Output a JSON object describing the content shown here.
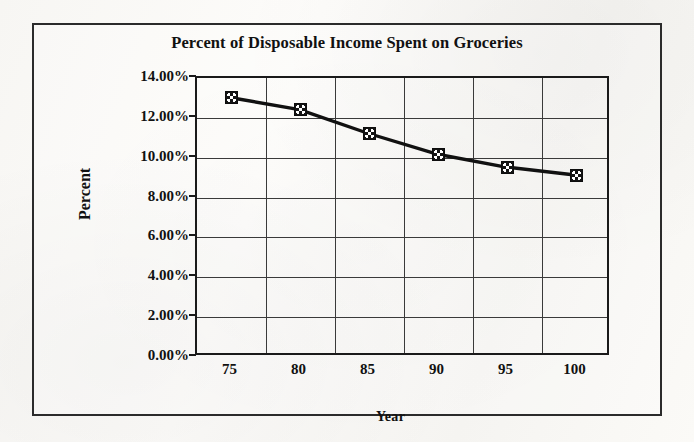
{
  "chart_data": {
    "type": "line",
    "title": "Percent of Disposable Income Spent on Groceries",
    "xlabel": "Year",
    "ylabel": "Percent",
    "categories": [
      "75",
      "80",
      "85",
      "90",
      "95",
      "100"
    ],
    "values": [
      13.0,
      12.4,
      11.2,
      10.15,
      9.5,
      9.1
    ],
    "series": [
      {
        "name": "Percent of Disposable Income Spent on Groceries",
        "values": [
          13.0,
          12.4,
          11.2,
          10.15,
          9.5,
          9.1
        ]
      }
    ],
    "ytick_labels": [
      "14.00%",
      "12.00%",
      "10.00%",
      "8.00%",
      "6.00%",
      "4.00%",
      "2.00%",
      "0.00%"
    ],
    "ytick_values": [
      14,
      12,
      10,
      8,
      6,
      4,
      2,
      0
    ],
    "ylim": [
      0,
      14
    ],
    "ytick_format": "percent",
    "grid": "both",
    "legend": "none",
    "line_color": "#111111",
    "marker_color": "#141414",
    "marker_shape": "square-dotted",
    "background_color": "#fbfaf8",
    "border_color": "#2b2b2b"
  }
}
